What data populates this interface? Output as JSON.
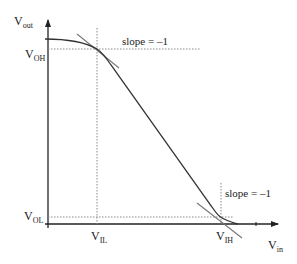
{
  "diagram": {
    "axes": {
      "y_label": "V",
      "y_label_sub": "out",
      "x_label": "V",
      "x_label_sub": "in"
    },
    "levels": {
      "voh": {
        "main": "V",
        "sub": "OH"
      },
      "vol": {
        "main": "V",
        "sub": "OL"
      },
      "vil": {
        "main": "V",
        "sub": "IL"
      },
      "vih": {
        "main": "V",
        "sub": "IH"
      }
    },
    "annotations": {
      "slope_top": "slope = –1",
      "slope_bottom": "slope = –1"
    },
    "colors": {
      "curve": "#333333",
      "tangent": "#777777",
      "dashed": "#888888",
      "axis": "#222222"
    }
  }
}
